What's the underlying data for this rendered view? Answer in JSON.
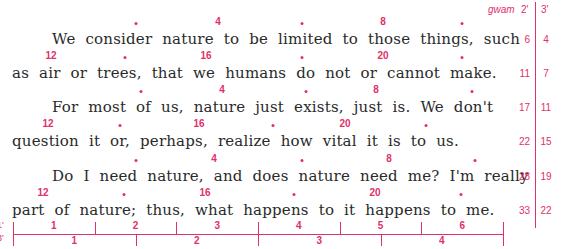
{
  "header": {
    "gwam_label": "gwam",
    "col_2min": "2'",
    "col_3min": "3'"
  },
  "lines": [
    {
      "text": "We consider nature to be limited to those things, such",
      "indent": true,
      "gwam2": "6",
      "gwam3": "4",
      "markers": [
        {
          "type": "dot",
          "x": 136
        },
        {
          "type": "num",
          "x": 218,
          "label": "4"
        },
        {
          "type": "dot",
          "x": 302
        },
        {
          "type": "num",
          "x": 383,
          "label": "8"
        },
        {
          "type": "dot",
          "x": 462
        }
      ]
    },
    {
      "text": "as air or trees, that we humans do not or cannot make.",
      "indent": false,
      "gwam2": "11",
      "gwam3": "7",
      "markers": [
        {
          "type": "num",
          "x": 51,
          "label": "12"
        },
        {
          "type": "dot",
          "x": 125
        },
        {
          "type": "num",
          "x": 206,
          "label": "16"
        },
        {
          "type": "dot",
          "x": 302
        },
        {
          "type": "num",
          "x": 383,
          "label": "20"
        },
        {
          "type": "dot",
          "x": 462
        }
      ]
    },
    {
      "text": "For most of us, nature just exists, just is.  We don't",
      "indent": true,
      "gwam2": "17",
      "gwam3": "11",
      "markers": [
        {
          "type": "dot",
          "x": 141
        },
        {
          "type": "num",
          "x": 222,
          "label": "4"
        },
        {
          "type": "dot",
          "x": 306
        },
        {
          "type": "num",
          "x": 376,
          "label": "8"
        },
        {
          "type": "dot",
          "x": 472
        }
      ]
    },
    {
      "text": "question it or, perhaps, realize how vital it is to us.",
      "indent": false,
      "gwam2": "22",
      "gwam3": "15",
      "markers": [
        {
          "type": "num",
          "x": 48,
          "label": "12"
        },
        {
          "type": "dot",
          "x": 120
        },
        {
          "type": "num",
          "x": 199,
          "label": "16"
        },
        {
          "type": "dot",
          "x": 273
        },
        {
          "type": "num",
          "x": 345,
          "label": "20"
        },
        {
          "type": "dot",
          "x": 426
        }
      ]
    },
    {
      "text": "Do I need nature, and does nature need me?  I'm really",
      "indent": true,
      "gwam2": "28",
      "gwam3": "19",
      "markers": [
        {
          "type": "dot",
          "x": 136
        },
        {
          "type": "num",
          "x": 214,
          "label": "4"
        },
        {
          "type": "dot",
          "x": 302
        },
        {
          "type": "num",
          "x": 389,
          "label": "8"
        },
        {
          "type": "dot",
          "x": 475
        }
      ]
    },
    {
      "text": "part of nature; thus, what happens to it happens to me.",
      "indent": false,
      "gwam2": "33",
      "gwam3": "22",
      "markers": [
        {
          "type": "num",
          "x": 43,
          "label": "12"
        },
        {
          "type": "dot",
          "x": 124
        },
        {
          "type": "num",
          "x": 205,
          "label": "16"
        },
        {
          "type": "dot",
          "x": 294
        },
        {
          "type": "num",
          "x": 375,
          "label": "20"
        },
        {
          "type": "dot",
          "x": 461
        }
      ]
    }
  ],
  "scale": {
    "top_label": "1'",
    "bottom_label": "3'",
    "top_segments": [
      "1",
      "2",
      "3",
      "4",
      "5",
      "6"
    ],
    "bottom_segments": [
      "1",
      "2",
      "3",
      "4"
    ]
  },
  "colors": {
    "accent": "#e0306a",
    "text": "#2a2a2a"
  }
}
